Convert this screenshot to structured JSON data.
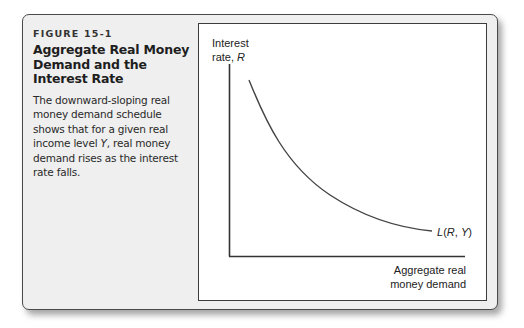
{
  "figure": {
    "label": "FIGURE 15-1",
    "title": "Aggregate Real Money Demand and the Interest Rate",
    "description": "The downward-sloping real money demand schedule shows that for a given real income level Y, real money demand rises as the interest rate falls.",
    "description_lines": [
      "The downward-sloping real",
      "money demand schedule",
      "shows that for a given real",
      "income level Y, real money",
      "demand rises as the interest",
      "rate falls."
    ]
  },
  "chart_data": {
    "type": "line",
    "title": "Aggregate Real Money Demand and the Interest Rate",
    "xlabel": "Aggregate real money demand",
    "ylabel": "Interest rate, R",
    "ylabel_lines": [
      "Interest",
      "rate, R"
    ],
    "xlabel_lines": [
      "Aggregate real",
      "money demand"
    ],
    "grid": false,
    "legend": null,
    "axis_ticks": "none",
    "series": [
      {
        "name": "L(R, Y)",
        "description": "Downward-sloping, convex real money demand schedule",
        "points_relative": [
          {
            "x": 0.08,
            "y": 0.91
          },
          {
            "x": 0.15,
            "y": 0.72
          },
          {
            "x": 0.25,
            "y": 0.52
          },
          {
            "x": 0.38,
            "y": 0.36
          },
          {
            "x": 0.52,
            "y": 0.24
          },
          {
            "x": 0.67,
            "y": 0.17
          },
          {
            "x": 0.86,
            "y": 0.13
          }
        ]
      }
    ],
    "annotations": [
      {
        "text": "L(R, Y)",
        "position": "end of curve, lower right"
      }
    ]
  }
}
